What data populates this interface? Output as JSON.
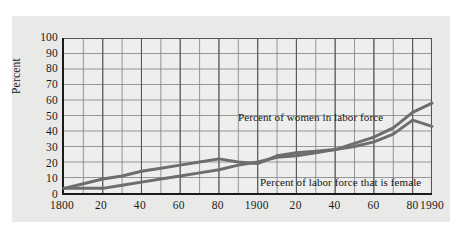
{
  "chart_data": {
    "type": "line",
    "title": "",
    "xlabel": "",
    "ylabel": "Percent",
    "xlim": [
      1800,
      1990
    ],
    "ylim": [
      0,
      100
    ],
    "grid": true,
    "legend": "inline-annotations",
    "y_ticks": [
      100,
      90,
      80,
      70,
      60,
      50,
      40,
      30,
      20,
      10,
      0
    ],
    "x_ticks": [
      {
        "value": 1800,
        "label": "1800"
      },
      {
        "value": 1820,
        "label": "20"
      },
      {
        "value": 1840,
        "label": "40"
      },
      {
        "value": 1860,
        "label": "60"
      },
      {
        "value": 1880,
        "label": "80"
      },
      {
        "value": 1900,
        "label": "1900"
      },
      {
        "value": 1920,
        "label": "20"
      },
      {
        "value": 1940,
        "label": "40"
      },
      {
        "value": 1960,
        "label": "60"
      },
      {
        "value": 1980,
        "label": "80"
      },
      {
        "value": 1990,
        "label": "1990"
      }
    ],
    "x_minor_step": 10,
    "series": [
      {
        "name": "Percent of women in labor force",
        "color": "#6d6d6d",
        "x": [
          1800,
          1810,
          1820,
          1830,
          1840,
          1850,
          1860,
          1870,
          1880,
          1890,
          1900,
          1910,
          1920,
          1930,
          1940,
          1950,
          1960,
          1970,
          1980,
          1990
        ],
        "values": [
          3,
          3,
          3,
          5,
          7,
          9,
          11,
          13,
          15,
          18,
          20,
          23,
          24,
          26,
          28,
          32,
          36,
          42,
          52,
          58
        ]
      },
      {
        "name": "Percent of labor force that is female",
        "color": "#6d6d6d",
        "x": [
          1800,
          1810,
          1820,
          1830,
          1840,
          1850,
          1860,
          1870,
          1880,
          1890,
          1900,
          1910,
          1920,
          1930,
          1940,
          1950,
          1960,
          1970,
          1980,
          1990
        ],
        "values": [
          3,
          6,
          9,
          11,
          14,
          16,
          18,
          20,
          22,
          20,
          19,
          24,
          26,
          27,
          28,
          30,
          33,
          38,
          47,
          43
        ]
      }
    ],
    "annotations": [
      {
        "text": "Percent of women in labor force",
        "x": 1895,
        "y": 55
      },
      {
        "text": "Percent of labor force that is female",
        "x": 1907,
        "y": 13
      }
    ]
  },
  "axis": {
    "y_label": "Percent"
  }
}
